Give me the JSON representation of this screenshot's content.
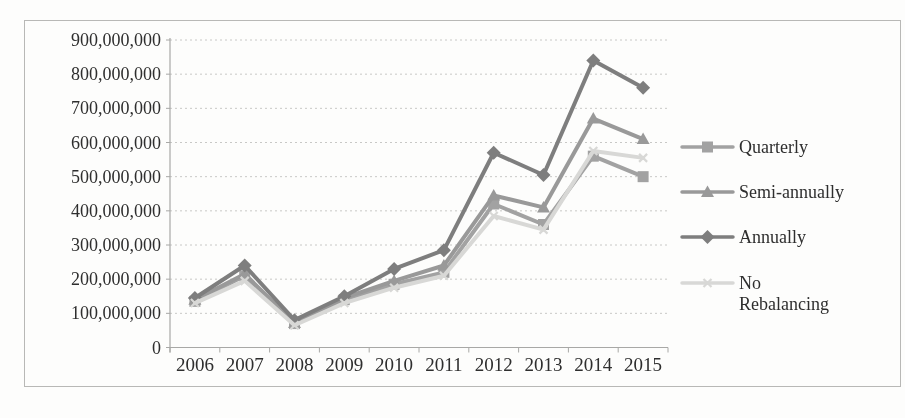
{
  "chart_data": {
    "type": "line",
    "title": "",
    "xlabel": "",
    "ylabel": "",
    "x_categories": [
      "2006",
      "2007",
      "2008",
      "2009",
      "2010",
      "2011",
      "2012",
      "2013",
      "2014",
      "2015"
    ],
    "series": [
      {
        "name": "Quarterly",
        "marker": "square",
        "color": "#a2a2a2",
        "values": [
          135000000,
          210000000,
          70000000,
          140000000,
          185000000,
          220000000,
          420000000,
          360000000,
          560000000,
          500000000
        ]
      },
      {
        "name": "Semi-annually",
        "marker": "triangle",
        "color": "#999999",
        "values": [
          140000000,
          215000000,
          72000000,
          145000000,
          195000000,
          240000000,
          445000000,
          410000000,
          670000000,
          610000000
        ]
      },
      {
        "name": "Annually",
        "marker": "diamond",
        "color": "#7e7e7e",
        "values": [
          145000000,
          240000000,
          80000000,
          150000000,
          230000000,
          285000000,
          570000000,
          505000000,
          840000000,
          760000000
        ]
      },
      {
        "name": "No Rebalancing",
        "legend_label_lines": [
          "No",
          "Rebalancing"
        ],
        "marker": "x",
        "color": "#d8d8d6",
        "values": [
          130000000,
          195000000,
          65000000,
          130000000,
          175000000,
          210000000,
          385000000,
          345000000,
          575000000,
          555000000
        ]
      }
    ],
    "y_axis": {
      "min": 0,
      "max": 900000000,
      "tick_interval": 100000000,
      "tick_labels": [
        "0",
        "100,000,000",
        "200,000,000",
        "300,000,000",
        "400,000,000",
        "500,000,000",
        "600,000,000",
        "700,000,000",
        "800,000,000",
        "900,000,000"
      ]
    },
    "grid": "horizontal-dotted",
    "legend_position": "right",
    "colors": {
      "gridline": "#c8c8c6",
      "axis": "#a8a8a6",
      "text": "#2e2e2e",
      "frame": "#b8b8b6",
      "background": "#fdfdfc"
    }
  }
}
